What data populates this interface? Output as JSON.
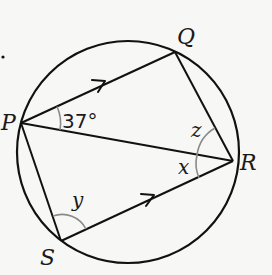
{
  "diagram": {
    "type": "circle-geometry",
    "circle": {
      "cx": 128,
      "cy": 152,
      "r": 111
    },
    "points": {
      "P": {
        "label": "P",
        "x": 21,
        "y": 123
      },
      "Q": {
        "label": "Q",
        "x": 175,
        "y": 52
      },
      "R": {
        "label": "R",
        "x": 233,
        "y": 161
      },
      "S": {
        "label": "S",
        "x": 61,
        "y": 241
      }
    },
    "segments": [
      "PQ",
      "QR",
      "PR",
      "PS",
      "SR"
    ],
    "parallel_marks": [
      "PQ",
      "SR"
    ],
    "angles": {
      "QPR": {
        "label": "37°"
      },
      "PRQ": {
        "label": "z"
      },
      "PRS": {
        "label": "x"
      },
      "PSR": {
        "label": "y"
      }
    },
    "dot": {
      "x": 3,
      "y": 57
    },
    "colors": {
      "line": "#111111",
      "arc": "#8a8a8a",
      "background": "#f7f7f5"
    }
  }
}
